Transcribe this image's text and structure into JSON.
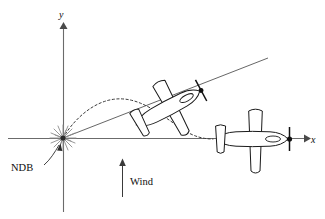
{
  "figure": {
    "title": "",
    "background_color": "#ffffff",
    "width": 325,
    "height": 219
  },
  "axes": {
    "x_label": "x",
    "y_label": "y",
    "origin": {
      "x": 63,
      "y": 138
    },
    "x_axis": {
      "start_x": 8,
      "end_x": 308,
      "y": 138,
      "color": "#6b6b6b"
    },
    "y_axis": {
      "x": 63,
      "start_y": 212,
      "end_y": 24,
      "color": "#6b6b6b"
    }
  },
  "labels": {
    "ndb": "NDB",
    "wind": "Wind"
  },
  "markers": {
    "ndb_station": {
      "name": "NDB",
      "type": "starburst",
      "x": 63,
      "y": 138,
      "color": "#8d8d8d"
    }
  },
  "annotations": {
    "wind_arrow": {
      "label": "Wind",
      "direction": "up",
      "x": 122,
      "tail_y": 197,
      "head_y": 160,
      "color": "#3a3a3a"
    },
    "ndb_leader": {
      "from_x": 42,
      "from_y": 166,
      "to_x": 60,
      "to_y": 143
    }
  },
  "aircraft": [
    {
      "id": "aircraft-middle",
      "position": {
        "x": 163,
        "y": 110
      },
      "rotation_deg": -28,
      "heading": "down-left",
      "scale": 1.0
    },
    {
      "id": "aircraft-right",
      "position": {
        "x": 250,
        "y": 139
      },
      "rotation_deg": 180,
      "heading": "left",
      "scale": 1.0
    }
  ],
  "tracks": {
    "straight_line": {
      "description": "bearing line through NDB",
      "x1": 63,
      "y1": 138,
      "x2": 268,
      "y2": 58,
      "style": "solid",
      "color": "#555555"
    },
    "curved_path": {
      "description": "homing flight path",
      "style": "dashed",
      "color": "#3a3a3a",
      "points": [
        {
          "x": 63,
          "y": 138
        },
        {
          "x": 82,
          "y": 112
        },
        {
          "x": 110,
          "y": 99
        },
        {
          "x": 138,
          "y": 104
        },
        {
          "x": 160,
          "y": 116
        },
        {
          "x": 185,
          "y": 131
        },
        {
          "x": 213,
          "y": 139
        }
      ]
    }
  },
  "icons": {
    "x_axis_arrow": "arrow-right-icon",
    "y_axis_arrow": "arrow-up-icon",
    "wind_arrow": "arrow-up-icon",
    "ndb_burst": "starburst-icon"
  }
}
